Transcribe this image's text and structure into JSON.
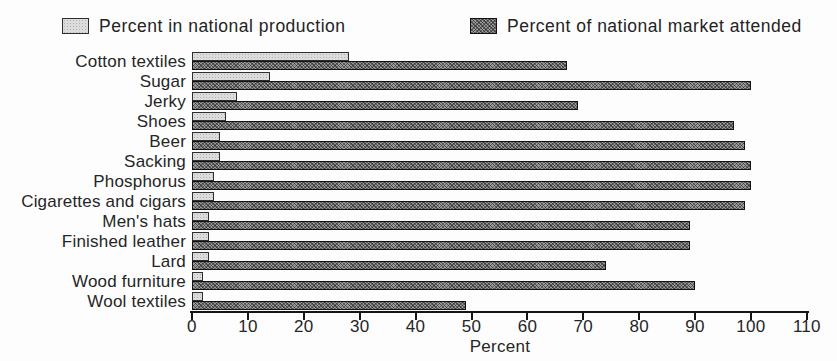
{
  "legend": {
    "position": "top"
  },
  "chart_data": {
    "type": "bar",
    "orientation": "horizontal",
    "title": "",
    "xlabel": "Percent",
    "ylabel": "",
    "xlim": [
      0,
      110
    ],
    "x_ticks": [
      0,
      10,
      20,
      30,
      40,
      50,
      60,
      70,
      80,
      90,
      100,
      110
    ],
    "grid": false,
    "legend_position": "top",
    "categories": [
      "Cotton textiles",
      "Sugar",
      "Jerky",
      "Shoes",
      "Beer",
      "Sacking",
      "Phosphorus",
      "Cigarettes and cigars",
      "Men's hats",
      "Finished leather",
      "Lard",
      "Wood furniture",
      "Wool textiles"
    ],
    "series": [
      {
        "name": "Percent in national production",
        "swatch_color": "#dcdcdc",
        "pattern": "fine-dots",
        "values": [
          28,
          14,
          8,
          6,
          5,
          5,
          4,
          4,
          3,
          3,
          3,
          2,
          2
        ]
      },
      {
        "name": "Percent of national market attended",
        "swatch_color": "#9a9a9a",
        "pattern": "crosshatch",
        "values": [
          67,
          100,
          69,
          97,
          99,
          100,
          100,
          99,
          89,
          89,
          74,
          90,
          49
        ]
      }
    ]
  }
}
